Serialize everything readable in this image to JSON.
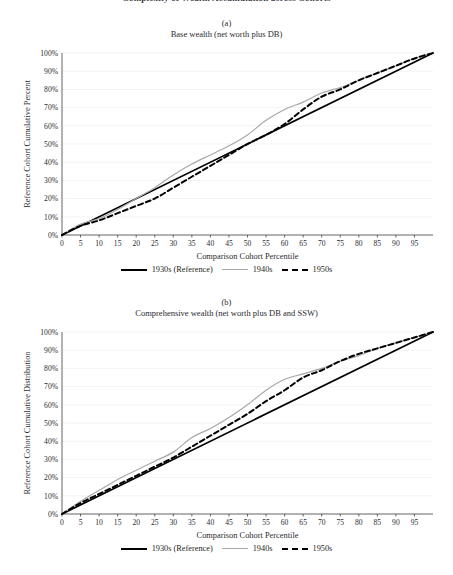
{
  "figure": {
    "clipped_header": "Complexity of Wealth Accumulation across Cohorts"
  },
  "panels": [
    {
      "letter": "(a)",
      "subtitle": "Base wealth (net worth plus DB)",
      "ylabel": "Reference Cohort Cumulative Percent",
      "xlabel": "Comparison Cohort Percentile"
    },
    {
      "letter": "(b)",
      "subtitle": "Comprehensive wealth (net worth plus DB and SSW)",
      "ylabel": "Reference Cohort Cumulative Distribution",
      "xlabel": "Comparison Cohort Percentile"
    }
  ],
  "legend": {
    "items": [
      {
        "label": "1930s (Reference)",
        "style": "solid-black",
        "color": "#000000"
      },
      {
        "label": "1940s",
        "style": "solid-gray",
        "color": "#a8a8a8"
      },
      {
        "label": "1950s",
        "style": "dash-black",
        "color": "#000000"
      }
    ]
  },
  "axes": {
    "y_ticks": [
      "0%",
      "10%",
      "20%",
      "30%",
      "40%",
      "50%",
      "60%",
      "70%",
      "80%",
      "90%",
      "100%"
    ],
    "x_ticks": [
      "0",
      "5",
      "10",
      "15",
      "20",
      "25",
      "30",
      "35",
      "40",
      "45",
      "50",
      "55",
      "60",
      "65",
      "70",
      "75",
      "80",
      "85",
      "90",
      "95"
    ]
  },
  "chart_data": [
    {
      "type": "line",
      "panel": "(a)",
      "title": "Base wealth (net worth plus DB)",
      "xlabel": "Comparison Cohort Percentile",
      "ylabel": "Reference Cohort Cumulative Percent",
      "xlim": [
        0,
        100
      ],
      "ylim": [
        0,
        100
      ],
      "xticks": [
        0,
        5,
        10,
        15,
        20,
        25,
        30,
        35,
        40,
        45,
        50,
        55,
        60,
        65,
        70,
        75,
        80,
        85,
        90,
        95
      ],
      "yticks": [
        0,
        10,
        20,
        30,
        40,
        50,
        60,
        70,
        80,
        90,
        100
      ],
      "grid": true,
      "legend_position": "bottom",
      "x": [
        0,
        5,
        10,
        15,
        20,
        25,
        30,
        35,
        40,
        45,
        50,
        55,
        60,
        65,
        70,
        75,
        80,
        85,
        90,
        95,
        100
      ],
      "series": [
        {
          "name": "1930s (Reference)",
          "style": "solid",
          "color": "#000000",
          "values": [
            0,
            5,
            10,
            15,
            20,
            25,
            30,
            35,
            40,
            45,
            50,
            55,
            60,
            65,
            70,
            75,
            80,
            85,
            90,
            95,
            100
          ]
        },
        {
          "name": "1940s",
          "style": "solid",
          "color": "#a8a8a8",
          "values": [
            0,
            6,
            9,
            14,
            20,
            26,
            33,
            39,
            44,
            49,
            55,
            63,
            69,
            73,
            78,
            81,
            85,
            89,
            93,
            97,
            100
          ]
        },
        {
          "name": "1950s",
          "style": "dashed",
          "color": "#000000",
          "values": [
            0,
            5,
            8,
            12,
            16,
            20,
            26,
            32,
            38,
            44,
            50,
            55,
            61,
            69,
            76,
            80,
            85,
            89,
            93,
            97,
            100
          ]
        }
      ]
    },
    {
      "type": "line",
      "panel": "(b)",
      "title": "Comprehensive wealth (net worth plus DB and SSW)",
      "xlabel": "Comparison Cohort Percentile",
      "ylabel": "Reference Cohort Cumulative Distribution",
      "xlim": [
        0,
        100
      ],
      "ylim": [
        0,
        100
      ],
      "xticks": [
        0,
        5,
        10,
        15,
        20,
        25,
        30,
        35,
        40,
        45,
        50,
        55,
        60,
        65,
        70,
        75,
        80,
        85,
        90,
        95
      ],
      "yticks": [
        0,
        10,
        20,
        30,
        40,
        50,
        60,
        70,
        80,
        90,
        100
      ],
      "grid": true,
      "legend_position": "bottom",
      "x": [
        0,
        5,
        10,
        15,
        20,
        25,
        30,
        35,
        40,
        45,
        50,
        55,
        60,
        65,
        70,
        75,
        80,
        85,
        90,
        95,
        100
      ],
      "series": [
        {
          "name": "1930s (Reference)",
          "style": "solid",
          "color": "#000000",
          "values": [
            0,
            5,
            10,
            15,
            20,
            25,
            30,
            35,
            40,
            45,
            50,
            55,
            60,
            65,
            70,
            75,
            80,
            85,
            90,
            95,
            100
          ]
        },
        {
          "name": "1940s",
          "style": "solid",
          "color": "#a8a8a8",
          "values": [
            0,
            7,
            13,
            19,
            24,
            29,
            34,
            42,
            47,
            53,
            60,
            68,
            74,
            77,
            80,
            84,
            87,
            91,
            94,
            97,
            100
          ]
        },
        {
          "name": "1950s",
          "style": "dashed",
          "color": "#000000",
          "values": [
            0,
            6,
            11,
            16,
            21,
            26,
            31,
            37,
            43,
            49,
            55,
            62,
            68,
            75,
            79,
            84,
            88,
            91,
            94,
            97,
            100
          ]
        }
      ]
    }
  ]
}
